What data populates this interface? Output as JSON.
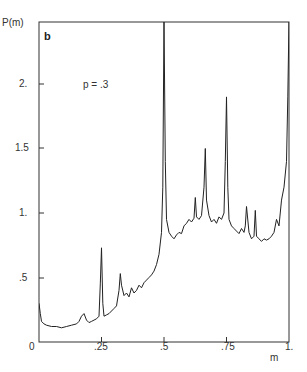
{
  "chart_data": {
    "type": "line",
    "title": "",
    "panel_label": "b",
    "annotation": "p = .3",
    "xlabel": "m",
    "ylabel": "P(m)",
    "xlim": [
      0,
      1
    ],
    "ylim": [
      0,
      2.2
    ],
    "x_ticks": [
      0,
      0.25,
      0.5,
      0.75,
      1
    ],
    "x_tick_labels": [
      "0",
      ".25",
      ".5",
      ".75",
      "1."
    ],
    "y_ticks": [
      0.5,
      1,
      1.5,
      2
    ],
    "y_tick_labels": [
      ".5",
      "1.",
      "1.5",
      "2."
    ],
    "grid": false,
    "legend": "none",
    "series": [
      {
        "name": "P(m)",
        "x": [
          0.0,
          0.005,
          0.01,
          0.02,
          0.03,
          0.05,
          0.07,
          0.09,
          0.11,
          0.13,
          0.15,
          0.16,
          0.17,
          0.18,
          0.19,
          0.2,
          0.21,
          0.22,
          0.23,
          0.24,
          0.245,
          0.25,
          0.255,
          0.26,
          0.27,
          0.28,
          0.29,
          0.3,
          0.31,
          0.32,
          0.325,
          0.33,
          0.34,
          0.35,
          0.36,
          0.37,
          0.38,
          0.39,
          0.4,
          0.41,
          0.42,
          0.43,
          0.44,
          0.45,
          0.46,
          0.47,
          0.48,
          0.49,
          0.495,
          0.5,
          0.505,
          0.51,
          0.52,
          0.53,
          0.54,
          0.55,
          0.56,
          0.57,
          0.58,
          0.59,
          0.6,
          0.61,
          0.62,
          0.625,
          0.63,
          0.64,
          0.65,
          0.66,
          0.665,
          0.67,
          0.68,
          0.69,
          0.7,
          0.71,
          0.72,
          0.73,
          0.74,
          0.745,
          0.75,
          0.755,
          0.76,
          0.77,
          0.78,
          0.79,
          0.8,
          0.81,
          0.82,
          0.825,
          0.83,
          0.84,
          0.85,
          0.86,
          0.865,
          0.87,
          0.88,
          0.89,
          0.9,
          0.91,
          0.92,
          0.93,
          0.94,
          0.95,
          0.96,
          0.97,
          0.98,
          0.99,
          0.995,
          1.0
        ],
        "y": [
          0.3,
          0.22,
          0.16,
          0.14,
          0.13,
          0.12,
          0.12,
          0.11,
          0.12,
          0.13,
          0.14,
          0.16,
          0.2,
          0.22,
          0.17,
          0.15,
          0.16,
          0.17,
          0.18,
          0.2,
          0.45,
          0.73,
          0.3,
          0.2,
          0.21,
          0.22,
          0.24,
          0.26,
          0.28,
          0.4,
          0.53,
          0.44,
          0.36,
          0.38,
          0.35,
          0.42,
          0.38,
          0.4,
          0.44,
          0.42,
          0.46,
          0.48,
          0.5,
          0.52,
          0.55,
          0.6,
          0.68,
          0.85,
          1.2,
          2.5,
          1.4,
          0.95,
          0.85,
          0.82,
          0.8,
          0.83,
          0.85,
          0.84,
          0.9,
          0.92,
          0.95,
          0.93,
          0.96,
          1.12,
          0.97,
          0.95,
          0.98,
          1.2,
          1.5,
          1.1,
          0.98,
          0.93,
          0.95,
          0.92,
          0.97,
          0.95,
          1.0,
          1.4,
          1.9,
          1.2,
          0.95,
          0.9,
          0.88,
          0.86,
          0.84,
          0.88,
          0.85,
          0.9,
          1.05,
          0.85,
          0.8,
          0.82,
          1.02,
          0.82,
          0.8,
          0.78,
          0.8,
          0.79,
          0.8,
          0.82,
          0.85,
          0.95,
          0.9,
          1.1,
          1.2,
          1.4,
          1.9,
          2.5
        ]
      }
    ]
  }
}
